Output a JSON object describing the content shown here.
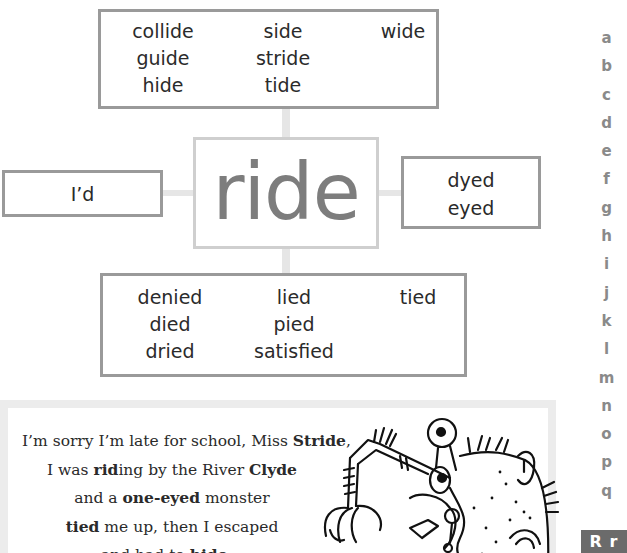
{
  "center_word": "ride",
  "top_box": {
    "columns": [
      [
        "collide",
        "guide",
        "hide"
      ],
      [
        "side",
        "stride",
        "tide"
      ],
      [
        "wide"
      ]
    ]
  },
  "left_box": {
    "words": [
      "I’d"
    ]
  },
  "right_box": {
    "words": [
      "dyed",
      "eyed"
    ]
  },
  "bottom_box": {
    "columns": [
      [
        "denied",
        "died",
        "dried"
      ],
      [
        "lied",
        "pied",
        "satisfied"
      ],
      [
        "tied"
      ]
    ]
  },
  "poem": {
    "lines": [
      [
        {
          "t": "I’m sorry I’m late for school, Miss "
        },
        {
          "t": "Stride",
          "b": true
        },
        {
          "t": ","
        }
      ],
      [
        {
          "t": "I was "
        },
        {
          "t": "rid",
          "b": true
        },
        {
          "t": "ing by the River "
        },
        {
          "t": "Clyde",
          "b": true
        }
      ],
      [
        {
          "t": "and a "
        },
        {
          "t": "one-eyed",
          "b": true
        },
        {
          "t": " monster"
        }
      ],
      [
        {
          "t": "tied",
          "b": true
        },
        {
          "t": " me up, then I escaped"
        }
      ],
      [
        {
          "t": "and had to "
        },
        {
          "t": "hide",
          "b": true
        },
        {
          "t": "…"
        }
      ]
    ],
    "illustration": "one-eyed-monster-drawing"
  },
  "alphabet_index": {
    "letters": [
      "a",
      "b",
      "c",
      "d",
      "e",
      "f",
      "g",
      "h",
      "i",
      "j",
      "k",
      "l",
      "m",
      "n",
      "o",
      "p",
      "q"
    ],
    "current": "R r"
  },
  "colors": {
    "box_border": "#9a9a9a",
    "center_border": "#cfcfcf",
    "center_text": "#7d7d7d",
    "connector": "#e6e6e6",
    "index_letters": "#8a8a8a",
    "index_current_bg": "#6b6b6b"
  }
}
